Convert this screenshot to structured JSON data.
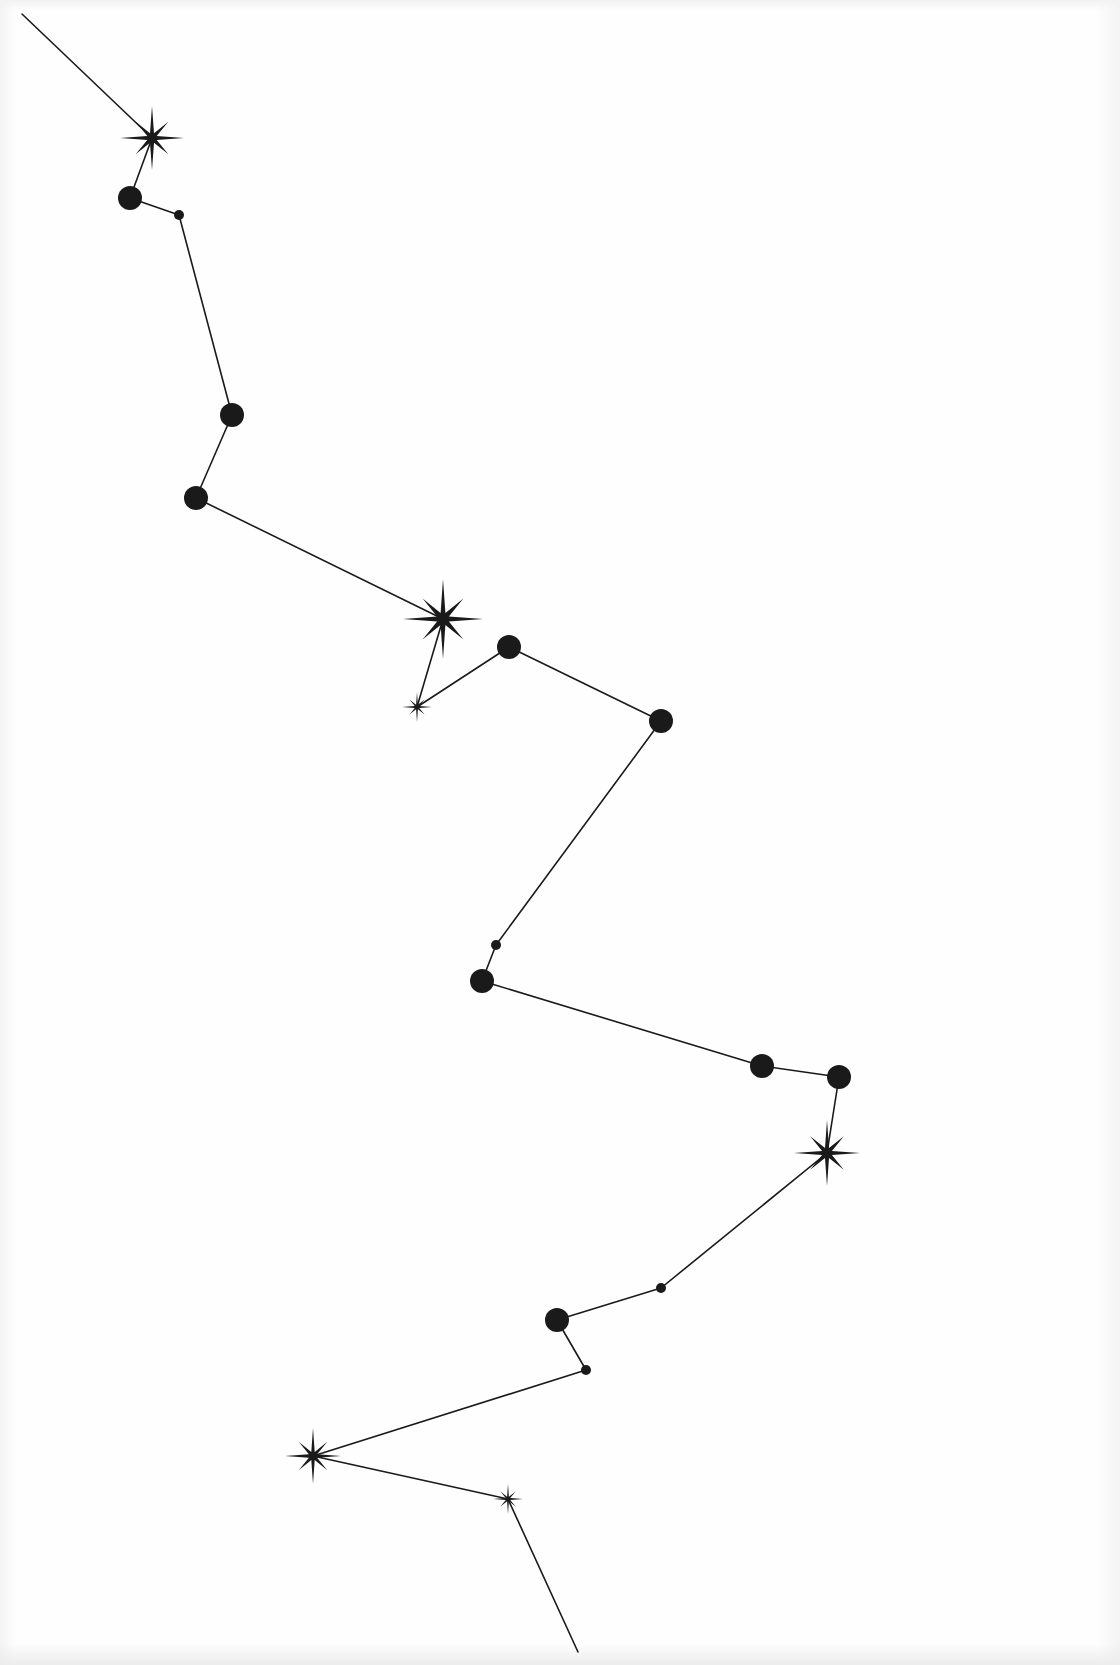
{
  "figure": {
    "type": "constellation",
    "background": "#fefefe",
    "ink": "#1a1a1a",
    "line_width": 1.6,
    "path_start": [
      22,
      14
    ],
    "path_end": [
      578,
      1652
    ],
    "nodes": [
      {
        "kind": "star",
        "x": 152,
        "y": 138,
        "r": 32
      },
      {
        "kind": "dot",
        "x": 130,
        "y": 198,
        "r": 12
      },
      {
        "kind": "dot",
        "x": 179,
        "y": 215,
        "r": 5
      },
      {
        "kind": "dot",
        "x": 232,
        "y": 415,
        "r": 12
      },
      {
        "kind": "dot",
        "x": 196,
        "y": 498,
        "r": 12
      },
      {
        "kind": "star",
        "x": 443,
        "y": 619,
        "r": 40
      },
      {
        "kind": "star",
        "x": 417,
        "y": 707,
        "r": 15
      },
      {
        "kind": "dot",
        "x": 509,
        "y": 647,
        "r": 12
      },
      {
        "kind": "dot",
        "x": 661,
        "y": 721,
        "r": 12
      },
      {
        "kind": "dot",
        "x": 496,
        "y": 945,
        "r": 5
      },
      {
        "kind": "dot",
        "x": 482,
        "y": 981,
        "r": 12
      },
      {
        "kind": "dot",
        "x": 762,
        "y": 1066,
        "r": 12
      },
      {
        "kind": "dot",
        "x": 839,
        "y": 1077,
        "r": 12
      },
      {
        "kind": "star",
        "x": 827,
        "y": 1153,
        "r": 33
      },
      {
        "kind": "dot",
        "x": 661,
        "y": 1288,
        "r": 5
      },
      {
        "kind": "dot",
        "x": 557,
        "y": 1320,
        "r": 12
      },
      {
        "kind": "dot",
        "x": 586,
        "y": 1370,
        "r": 5
      },
      {
        "kind": "star",
        "x": 313,
        "y": 1456,
        "r": 28
      },
      {
        "kind": "star",
        "x": 508,
        "y": 1499,
        "r": 15
      }
    ]
  }
}
